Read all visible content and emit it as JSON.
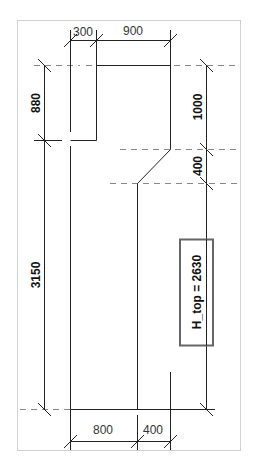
{
  "drawing": {
    "colors": {
      "line": "#222222",
      "dashed": "#888888",
      "frame": "#d0d0d0",
      "param_box": "#666666"
    },
    "dimensions": {
      "top_left": "300",
      "top_right": "900",
      "left_upper": "880",
      "left_lower": "3150",
      "right_upper": "1000",
      "right_middle": "400",
      "bottom_left": "800",
      "bottom_right": "400"
    },
    "parameter_label": "H_top = 2630"
  }
}
